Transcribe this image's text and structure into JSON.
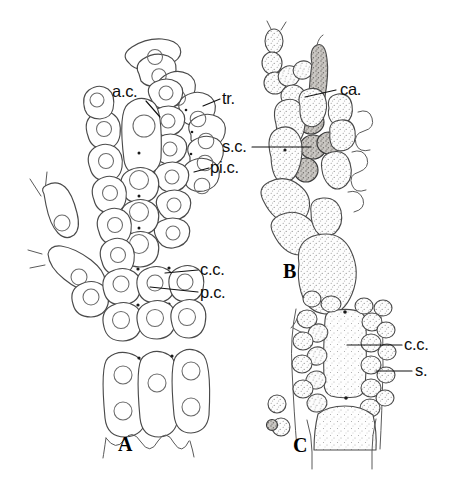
{
  "figure": {
    "background_color": "#ffffff",
    "ink_color": "#4a4a4a",
    "label_color": "#0d0d0d",
    "width": 469,
    "height": 482
  },
  "panels": [
    {
      "id": "A",
      "letter": "A",
      "letter_x": 118,
      "letter_y": 451,
      "description": "Branched filament with apical cell, trichome, pericentral and central cells"
    },
    {
      "id": "B",
      "letter": "B",
      "letter_x": 283,
      "letter_y": 278,
      "description": "Stippled carpogonial branch with carpogonium and supporting cell"
    },
    {
      "id": "C",
      "letter": "C",
      "letter_x": 293,
      "letter_y": 452,
      "description": "Tetrasporangial segment with central cell and spores"
    }
  ],
  "labels": [
    {
      "key": "ac",
      "text": "a.c.",
      "meaning": "apical cell",
      "text_x": 112,
      "text_y": 97,
      "anchor": "start",
      "leader": [
        [
          146,
          101
        ],
        [
          160,
          117
        ]
      ],
      "panel": "A"
    },
    {
      "key": "tr",
      "text": "tr.",
      "meaning": "trichome",
      "text_x": 222,
      "text_y": 104,
      "anchor": "start",
      "leader": [
        [
          220,
          99
        ],
        [
          203,
          106
        ]
      ],
      "panel": "A"
    },
    {
      "key": "sc",
      "text": "s.c.",
      "meaning": "supporting cell",
      "text_x": 222,
      "text_y": 152,
      "anchor": "start",
      "leader": [
        [
          252,
          147
        ],
        [
          311,
          147
        ]
      ],
      "panel": "B"
    },
    {
      "key": "pic",
      "text": "pi.c.",
      "meaning": "pericentral cell",
      "text_x": 210,
      "text_y": 173,
      "anchor": "start",
      "leader": [
        [
          209,
          168
        ],
        [
          194,
          172
        ]
      ],
      "panel": "A"
    },
    {
      "key": "ca",
      "text": "ca.",
      "meaning": "carpogonium",
      "text_x": 340,
      "text_y": 95,
      "anchor": "start",
      "leader": [
        [
          336,
          90
        ],
        [
          305,
          97
        ]
      ],
      "panel": "B"
    },
    {
      "key": "cc_a",
      "text": "c.c.",
      "meaning": "central cell",
      "text_x": 200,
      "text_y": 275,
      "anchor": "start",
      "leader": [
        [
          198,
          270
        ],
        [
          165,
          273
        ]
      ],
      "panel": "A"
    },
    {
      "key": "pc_a",
      "text": "p.c.",
      "meaning": "pericentral cell",
      "text_x": 200,
      "text_y": 298,
      "anchor": "start",
      "leader": [
        [
          198,
          292
        ],
        [
          150,
          287
        ]
      ],
      "panel": "A"
    },
    {
      "key": "cc_c",
      "text": "c.c.",
      "meaning": "central cell",
      "text_x": 404,
      "text_y": 350,
      "anchor": "start",
      "leader": [
        [
          402,
          345
        ],
        [
          347,
          345
        ]
      ],
      "panel": "C"
    },
    {
      "key": "s_c",
      "text": "s.",
      "meaning": "spore",
      "text_x": 415,
      "text_y": 376,
      "anchor": "start",
      "leader": [
        [
          412,
          371
        ],
        [
          376,
          371
        ]
      ],
      "panel": "C"
    }
  ],
  "legend_keys": [
    {
      "abbr": "a.c.",
      "term": "apical cell"
    },
    {
      "abbr": "tr.",
      "term": "trichome"
    },
    {
      "abbr": "pi.c.",
      "term": "pericentral cell"
    },
    {
      "abbr": "c.c.",
      "term": "central cell"
    },
    {
      "abbr": "p.c.",
      "term": "pericentral cell"
    },
    {
      "abbr": "ca.",
      "term": "carpogonium"
    },
    {
      "abbr": "s.c.",
      "term": "supporting cell"
    },
    {
      "abbr": "s.",
      "term": "spore"
    }
  ]
}
